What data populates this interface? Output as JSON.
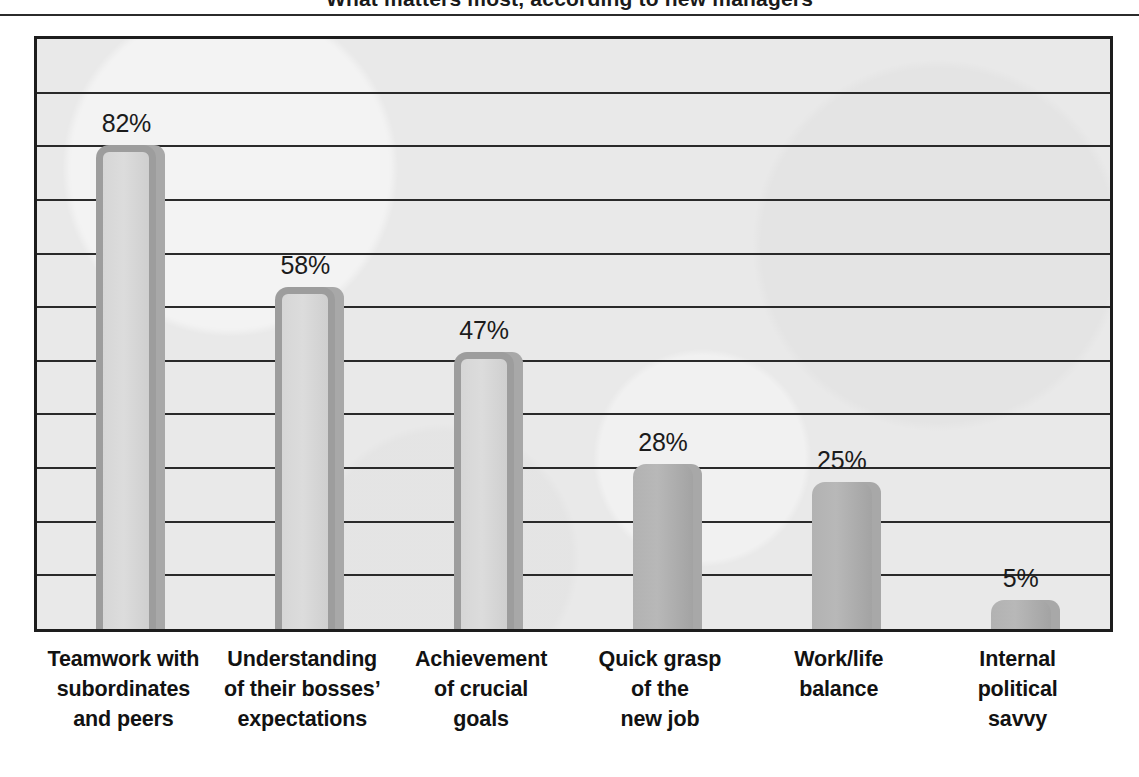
{
  "title": {
    "text": "What matters most, according to new managers",
    "note": "cropped at top edge"
  },
  "chart_data": {
    "type": "bar",
    "title": "What matters most, according to new managers",
    "xlabel": "",
    "ylabel": "",
    "ylim": [
      0,
      100
    ],
    "grid": true,
    "legend": false,
    "value_suffix": "%",
    "gridline_count": 10,
    "categories": [
      "Teamwork with subordinates and peers",
      "Understanding of their bosses' expectations",
      "Achievement of crucial goals",
      "Quick grasp of the new job",
      "Work/life balance",
      "Internal political savvy"
    ],
    "values": [
      82,
      58,
      47,
      28,
      25,
      5
    ],
    "value_labels": [
      "82%",
      "58%",
      "47%",
      "28%",
      "25%",
      "5%"
    ]
  },
  "bars": [
    {
      "name": "teamwork",
      "value_label": "82%",
      "value": 82,
      "style": "hollow",
      "label_lines": [
        "Teamwork with",
        "subordinates",
        "and peers"
      ]
    },
    {
      "name": "boss-expectations",
      "value_label": "58%",
      "value": 58,
      "style": "hollow",
      "label_lines": [
        "Understanding",
        "of their bosses’",
        "expectations"
      ]
    },
    {
      "name": "crucial-goals",
      "value_label": "47%",
      "value": 47,
      "style": "hollow",
      "label_lines": [
        "Achievement",
        "of crucial",
        "goals"
      ]
    },
    {
      "name": "quick-grasp",
      "value_label": "28%",
      "value": 28,
      "style": "solid",
      "label_lines": [
        "Quick grasp",
        "of the",
        "new job"
      ]
    },
    {
      "name": "work-life-balance",
      "value_label": "25%",
      "value": 25,
      "style": "solid",
      "label_lines": [
        "Work/life",
        "balance",
        ""
      ]
    },
    {
      "name": "political-savvy",
      "value_label": "5%",
      "value": 5,
      "style": "solid",
      "label_lines": [
        "Internal",
        "political",
        "savvy"
      ]
    }
  ],
  "colors": {
    "plot_background": "#e9e9e9",
    "frame": "#1d1d1d",
    "gridline": "#2a2a2a",
    "bar_fill": "#b2b2b2",
    "bar_outline": "#9d9d9d",
    "bar_shadow": "#a8a8a8",
    "text": "#121212",
    "page_background": "#ffffff"
  }
}
